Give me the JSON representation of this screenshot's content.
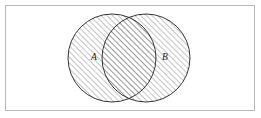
{
  "figure": {
    "kind": "venn-diagram",
    "caption": "",
    "canvas": {
      "width": 261,
      "height": 118,
      "background_color": "#ffffff"
    },
    "frame": {
      "name": "universal-set-rectangle",
      "x": 5,
      "y": 5,
      "width": 250,
      "height": 106,
      "stroke_color": "#b8b8b8",
      "stroke_width": 1,
      "fill": "none"
    },
    "hatch": {
      "pattern": "diagonal-45-up",
      "angle_degrees": 45,
      "spacing_px": 4,
      "stroke_color": "#3a3a3a",
      "stroke_width": 0.6
    },
    "circles": [
      {
        "id": "A",
        "name": "set-a-circle",
        "label": "A",
        "label_x": 94,
        "label_y": 58,
        "cx": 112,
        "cy": 58,
        "r": 44,
        "stroke_color": "#1f1f1f",
        "stroke_width": 0.9,
        "shaded": true
      },
      {
        "id": "B",
        "name": "set-b-circle",
        "label": "B",
        "label_x": 165,
        "label_y": 58,
        "cx": 146,
        "cy": 58,
        "r": 44,
        "stroke_color": "#1f1f1f",
        "stroke_width": 0.9,
        "shaded": true
      }
    ],
    "intersection": {
      "name": "a-intersect-b-lens",
      "shaded": true,
      "upper_point": {
        "x": 129,
        "y": 21
      },
      "lower_point": {
        "x": 129,
        "y": 96
      }
    }
  }
}
